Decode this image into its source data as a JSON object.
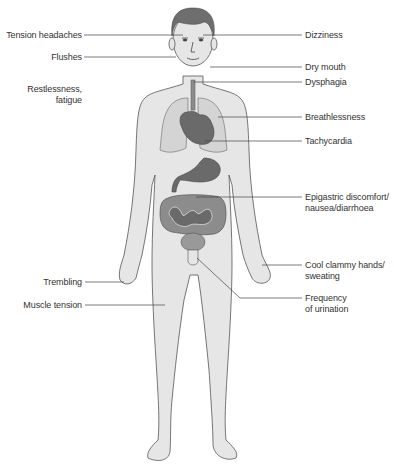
{
  "figure": {
    "left_labels": [
      {
        "id": "tension-headaches",
        "text": "Tension headaches"
      },
      {
        "id": "flushes",
        "text": "Flushes"
      },
      {
        "id": "restlessness",
        "line1": "Restlessness,",
        "line2": "fatigue"
      },
      {
        "id": "trembling",
        "text": "Trembling"
      },
      {
        "id": "muscle-tension",
        "text": "Muscle tension"
      }
    ],
    "right_labels": [
      {
        "id": "dizziness",
        "text": "Dizziness"
      },
      {
        "id": "dry-mouth",
        "text": "Dry mouth"
      },
      {
        "id": "dysphagia",
        "text": "Dysphagia"
      },
      {
        "id": "breathlessness",
        "text": "Breathlessness"
      },
      {
        "id": "tachycardia",
        "text": "Tachycardia"
      },
      {
        "id": "epigastric",
        "line1": "Epigastric discomfort/",
        "line2": "nausea/diarrhoea"
      },
      {
        "id": "cool-hands",
        "line1": "Cool clammy hands/",
        "line2": "sweating"
      },
      {
        "id": "frequency",
        "line1": "Frequency",
        "line2": "of urination"
      }
    ],
    "colors": {
      "skin": "#e6e6e6",
      "outline": "#555555",
      "hair": "#6e6e6e",
      "organ_dark": "#6a6a6a",
      "organ_mid": "#8c8c8c",
      "lung": "#d4d4d4",
      "leader_line": "#444444",
      "text": "#333333"
    }
  }
}
